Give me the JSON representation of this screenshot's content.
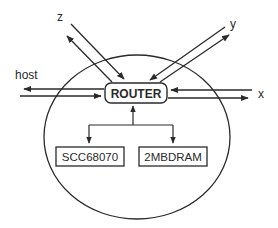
{
  "diagram": {
    "type": "node-architecture",
    "colors": {
      "stroke": "#2a2a2a",
      "background": "#ffffff"
    },
    "router": {
      "label": "ROUTER"
    },
    "components": [
      {
        "label": "SCC68070"
      },
      {
        "label": "2MBDRAM"
      }
    ],
    "ports": {
      "host": "host",
      "x": "x",
      "y": "y",
      "z": "z"
    }
  }
}
